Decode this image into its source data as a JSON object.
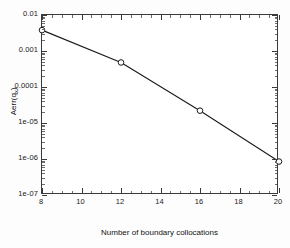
{
  "chart_data": {
    "type": "line",
    "title": "",
    "subtitle": "",
    "xlabel": "Number of boundary collocations",
    "ylabel": "Aerr(q_x)",
    "ylabel_base": "Aerr(q",
    "ylabel_sub": "x",
    "ylabel_tail": ")",
    "xscale": "linear",
    "yscale": "log",
    "xlim": [
      8,
      20
    ],
    "ylim": [
      1e-07,
      0.01
    ],
    "grid": false,
    "legend": null,
    "x": [
      8,
      12,
      16,
      20
    ],
    "values": [
      0.0038,
      0.00048,
      2.2e-05,
      8.5e-07
    ],
    "series": [
      {
        "name": "Aerr(q_x)",
        "x": [
          8,
          12,
          16,
          20
        ],
        "values": [
          0.0038,
          0.00048,
          2.2e-05,
          8.5e-07
        ],
        "marker": "circle",
        "line_style": "solid",
        "color": "#1a1a1a"
      }
    ],
    "xticks": [
      8,
      10,
      12,
      14,
      16,
      18,
      20
    ],
    "xtick_labels": [
      "8",
      "10",
      "12",
      "14",
      "16",
      "18",
      "20"
    ],
    "yticks": [
      0.01,
      0.001,
      0.0001,
      1e-05,
      1e-06,
      1e-07
    ],
    "ytick_labels": [
      "0.01",
      "0.001",
      "0.0001",
      "1e-05",
      "1e-06",
      "1e-07"
    ]
  },
  "colors": {
    "line": "#1a1a1a",
    "marker_edge": "#1a1a1a",
    "marker_face": "#ffffff",
    "axis": "#3a3a3a",
    "background": "#fdfdfd",
    "plot_background": "#ffffff",
    "text": "#111111"
  }
}
